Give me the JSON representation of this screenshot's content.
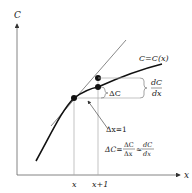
{
  "diagram": {
    "axes": {
      "y_label": "C",
      "x_label": "x"
    },
    "ticks": {
      "x": "x",
      "x_plus_1": "x+1"
    },
    "curve_label": "C=C(x)",
    "delta_c_label": "ΔC",
    "derivative_label": {
      "numerator": "dC",
      "denominator": "dx"
    },
    "delta_x_label": "Δx=1",
    "approximation": {
      "lhs": "ΔC=",
      "frac_num": "ΔC",
      "frac_den": "Δx",
      "approx": "≈",
      "rhs_num": "dC",
      "rhs_den": "dx"
    },
    "colors": {
      "curve": "#111111",
      "tangent": "#555555",
      "guides": "#999999",
      "axes": "#666666"
    }
  }
}
